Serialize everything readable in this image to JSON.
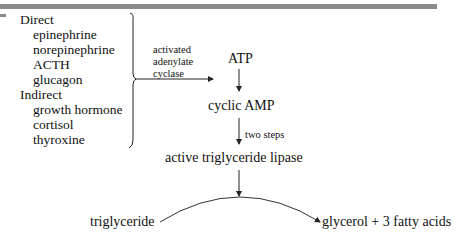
{
  "hormones": {
    "direct_label": "Direct",
    "direct": [
      "epinephrine",
      "norepinephrine",
      "ACTH",
      "glucagon"
    ],
    "indirect_label": "Indirect",
    "indirect": [
      "growth hormone",
      "cortisol",
      "thyroxine"
    ]
  },
  "pathway": {
    "enzyme_label_lines": [
      "activated",
      "adenylate",
      "cyclase"
    ],
    "atp": "ATP",
    "camp": "cyclic AMP",
    "two_steps": "two steps",
    "lipase": "active triglyceride lipase",
    "substrate": "triglyceride",
    "products": "glycerol + 3 fatty acids"
  }
}
